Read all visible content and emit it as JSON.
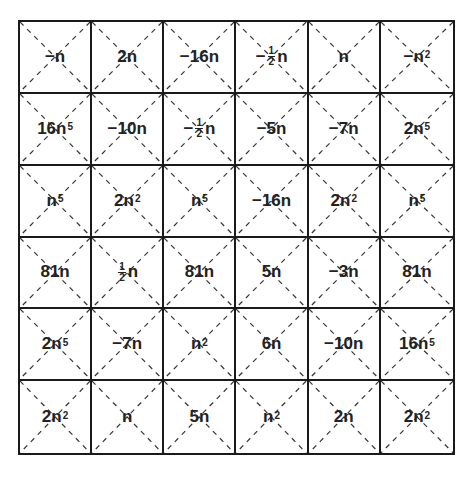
{
  "grid": {
    "rows": 6,
    "cols": 6,
    "line_color": "#1a1a1a",
    "diagonal_style": "dashed",
    "cells": [
      [
        {
          "sign": "−",
          "frac": null,
          "coef": "",
          "var": "n",
          "exp": ""
        },
        {
          "sign": "",
          "frac": null,
          "coef": "2",
          "var": "n",
          "exp": ""
        },
        {
          "sign": "−",
          "frac": null,
          "coef": "16",
          "var": "n",
          "exp": ""
        },
        {
          "sign": "−",
          "frac": {
            "num": "1",
            "den": "2"
          },
          "coef": "",
          "var": "n",
          "exp": ""
        },
        {
          "sign": "",
          "frac": null,
          "coef": "",
          "var": "n",
          "exp": ""
        },
        {
          "sign": "−",
          "frac": null,
          "coef": "",
          "var": "n",
          "exp": "2"
        }
      ],
      [
        {
          "sign": "",
          "frac": null,
          "coef": "16",
          "var": "n",
          "exp": "5"
        },
        {
          "sign": "−",
          "frac": null,
          "coef": "10",
          "var": "n",
          "exp": ""
        },
        {
          "sign": "−",
          "frac": {
            "num": "1",
            "den": "2"
          },
          "coef": "",
          "var": "n",
          "exp": ""
        },
        {
          "sign": "−",
          "frac": null,
          "coef": "5",
          "var": "n",
          "exp": ""
        },
        {
          "sign": "−",
          "frac": null,
          "coef": "7",
          "var": "n",
          "exp": ""
        },
        {
          "sign": "",
          "frac": null,
          "coef": "2",
          "var": "n",
          "exp": "5"
        }
      ],
      [
        {
          "sign": "",
          "frac": null,
          "coef": "",
          "var": "n",
          "exp": "5"
        },
        {
          "sign": "",
          "frac": null,
          "coef": "2",
          "var": "n",
          "exp": "2"
        },
        {
          "sign": "",
          "frac": null,
          "coef": "",
          "var": "n",
          "exp": "5"
        },
        {
          "sign": "−",
          "frac": null,
          "coef": "16",
          "var": "n",
          "exp": ""
        },
        {
          "sign": "",
          "frac": null,
          "coef": "2",
          "var": "n",
          "exp": "2"
        },
        {
          "sign": "",
          "frac": null,
          "coef": "",
          "var": "n",
          "exp": "5"
        }
      ],
      [
        {
          "sign": "",
          "frac": null,
          "coef": "81",
          "var": "n",
          "exp": ""
        },
        {
          "sign": "",
          "frac": {
            "num": "1",
            "den": "2"
          },
          "coef": "",
          "var": "n",
          "exp": ""
        },
        {
          "sign": "",
          "frac": null,
          "coef": "81",
          "var": "n",
          "exp": ""
        },
        {
          "sign": "",
          "frac": null,
          "coef": "5",
          "var": "n",
          "exp": ""
        },
        {
          "sign": "−",
          "frac": null,
          "coef": "3",
          "var": "n",
          "exp": ""
        },
        {
          "sign": "",
          "frac": null,
          "coef": "81",
          "var": "n",
          "exp": ""
        }
      ],
      [
        {
          "sign": "",
          "frac": null,
          "coef": "2",
          "var": "n",
          "exp": "5"
        },
        {
          "sign": "−",
          "frac": null,
          "coef": "7",
          "var": "n",
          "exp": ""
        },
        {
          "sign": "",
          "frac": null,
          "coef": "",
          "var": "n",
          "exp": "2"
        },
        {
          "sign": "",
          "frac": null,
          "coef": "6",
          "var": "n",
          "exp": ""
        },
        {
          "sign": "−",
          "frac": null,
          "coef": "10",
          "var": "n",
          "exp": ""
        },
        {
          "sign": "",
          "frac": null,
          "coef": "16",
          "var": "n",
          "exp": "5"
        }
      ],
      [
        {
          "sign": "",
          "frac": null,
          "coef": "2",
          "var": "n",
          "exp": "2"
        },
        {
          "sign": "",
          "frac": null,
          "coef": "",
          "var": "n",
          "exp": ""
        },
        {
          "sign": "",
          "frac": null,
          "coef": "5",
          "var": "n",
          "exp": ""
        },
        {
          "sign": "",
          "frac": null,
          "coef": "",
          "var": "n",
          "exp": "2"
        },
        {
          "sign": "",
          "frac": null,
          "coef": "2",
          "var": "n",
          "exp": ""
        },
        {
          "sign": "",
          "frac": null,
          "coef": "2",
          "var": "n",
          "exp": "2"
        }
      ]
    ]
  }
}
